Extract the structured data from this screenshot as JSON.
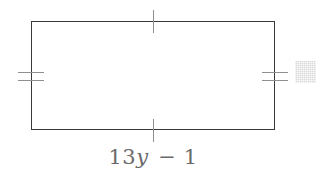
{
  "figure": {
    "kind": "geometry-diagram",
    "shape": "rectangle",
    "stroke_color": "#3a3a3a",
    "tick_color": "#8f8f8f",
    "label_color": "#6a6a6a",
    "background_color": "#ffffff",
    "rect": {
      "x": 31,
      "y": 21,
      "width": 244,
      "height": 109,
      "stroke_width": 1.6
    },
    "tick_marks": [
      {
        "name": "top-side-tick",
        "side": "top",
        "count": 1,
        "orientation": "vertical"
      },
      {
        "name": "bottom-side-tick",
        "side": "bottom",
        "count": 1,
        "orientation": "vertical"
      },
      {
        "name": "left-side-tick",
        "side": "left",
        "count": 2,
        "orientation": "horizontal"
      },
      {
        "name": "right-side-tick",
        "side": "right",
        "count": 2,
        "orientation": "horizontal"
      }
    ],
    "labels": {
      "bottom_side": {
        "full_text": "13y − 1",
        "coefficient": "13",
        "variable": "y",
        "operator": "−",
        "constant": "1"
      }
    },
    "artifact": {
      "name": "scan-artifact",
      "color": "#d9d9d9",
      "x": 295,
      "y": 61,
      "width": 21,
      "height": 22
    }
  }
}
